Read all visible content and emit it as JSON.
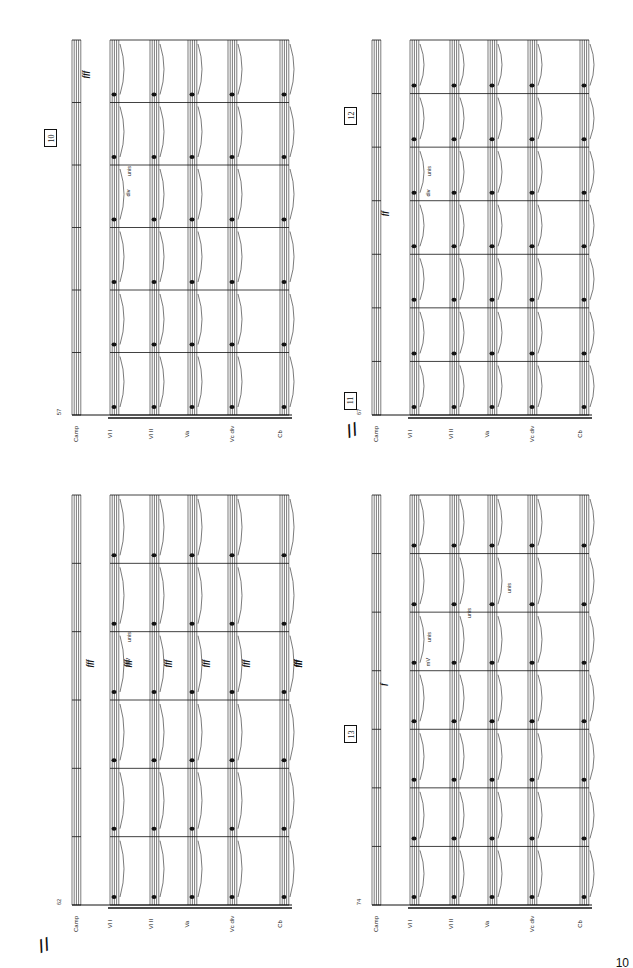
{
  "page": {
    "number": "10"
  },
  "instruments": [
    "Camp",
    "Vl I",
    "Vl II",
    "Va",
    "Vc div",
    "Cb"
  ],
  "systems": [
    {
      "id": "top-left",
      "measure_start": "57",
      "rehearsal": [
        "10"
      ],
      "measures": 6,
      "dynamics": [
        "fff"
      ],
      "texts": [
        "div",
        "unis"
      ]
    },
    {
      "id": "bottom-left",
      "measure_start": "62",
      "rehearsal": [],
      "measures": 6,
      "dynamics": [
        "fff",
        "fff",
        "fff",
        "fff",
        "fff",
        "fff",
        "fff"
      ],
      "texts": [
        "mV",
        "unis"
      ]
    },
    {
      "id": "top-right",
      "measure_start": "67",
      "rehearsal": [
        "11",
        "12"
      ],
      "measures": 7,
      "dynamics": [
        "ff"
      ],
      "texts": [
        "div",
        "unis"
      ]
    },
    {
      "id": "bottom-right",
      "measure_start": "74",
      "rehearsal": [
        "13"
      ],
      "measures": 7,
      "dynamics": [
        "f"
      ],
      "texts": [
        "mV",
        "unis",
        "unis",
        "unis"
      ]
    }
  ],
  "system_break": "//"
}
